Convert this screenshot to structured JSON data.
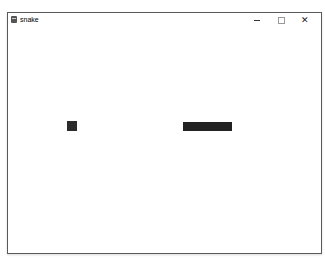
{
  "window": {
    "title": "snake",
    "icon": "python-app-icon",
    "controls": {
      "minimize": "minimize",
      "maximize": "maximize",
      "close": "✕"
    }
  },
  "game": {
    "background": "#ffffff",
    "food": {
      "color": "#2b2b2b",
      "x": 59,
      "y": 94,
      "size": 10
    },
    "snake": {
      "color": "#222222",
      "segments": 5,
      "segment_size": 10,
      "x": 175,
      "y": 95,
      "direction": "horizontal"
    }
  }
}
